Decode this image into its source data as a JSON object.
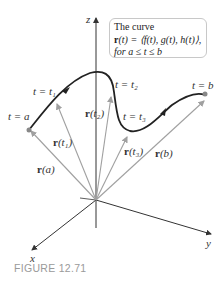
{
  "callout": {
    "line1": "The curve",
    "line2_bold": "r",
    "line2_rest": "(t) = ⟨f(t), g(t), h(t)⟩,",
    "line3": "for a ≤ t ≤ b"
  },
  "axes": {
    "x": "x",
    "y": "y",
    "z": "z"
  },
  "curve_labels": {
    "t_a": "t = a",
    "t_1": "t = t₁",
    "t_2": "t = t₂",
    "t_3": "t = t₃",
    "t_b": "t = b"
  },
  "vector_labels": {
    "r_a": "(a)",
    "r_t1": "(t₁)",
    "r_t2": "(t₂)",
    "r_t3": "(t₃)",
    "r_b": "(b)",
    "bold_r": "r"
  },
  "caption": "FIGURE 12.71",
  "colors": {
    "curve": "#222222",
    "vectors": "#a0a0a0",
    "axes": "#333333",
    "endpoint": "#888888",
    "caption": "#9a9a9a"
  }
}
